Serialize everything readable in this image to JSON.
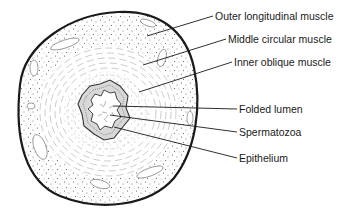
{
  "diagram": {
    "colors": {
      "ink": "#1a1a1a",
      "background": "#ffffff",
      "stipple": "#555555",
      "fiber": "#888888"
    },
    "labels": [
      {
        "id": "outer-longitudinal-muscle",
        "text": "Outer longitudinal muscle",
        "x": 215,
        "y": 10,
        "line": [
          [
            147,
            36
          ],
          [
            213,
            16
          ]
        ]
      },
      {
        "id": "middle-circular-muscle",
        "text": "Middle circular muscle",
        "x": 228,
        "y": 33,
        "line": [
          [
            143,
            65
          ],
          [
            226,
            39
          ]
        ]
      },
      {
        "id": "inner-oblique-muscle",
        "text": "Inner oblique muscle",
        "x": 234,
        "y": 56,
        "line": [
          [
            139,
            92
          ],
          [
            232,
            62
          ]
        ]
      },
      {
        "id": "folded-lumen",
        "text": "Folded lumen",
        "x": 239,
        "y": 103,
        "line": [
          [
            113,
            106
          ],
          [
            237,
            109
          ]
        ]
      },
      {
        "id": "spermatozoa",
        "text": "Spermatozoa",
        "x": 239,
        "y": 126,
        "line": [
          [
            110,
            115
          ],
          [
            237,
            132
          ]
        ]
      },
      {
        "id": "epithelium",
        "text": "Epithelium",
        "x": 239,
        "y": 152,
        "line": [
          [
            114,
            127
          ],
          [
            237,
            158
          ]
        ]
      }
    ]
  }
}
